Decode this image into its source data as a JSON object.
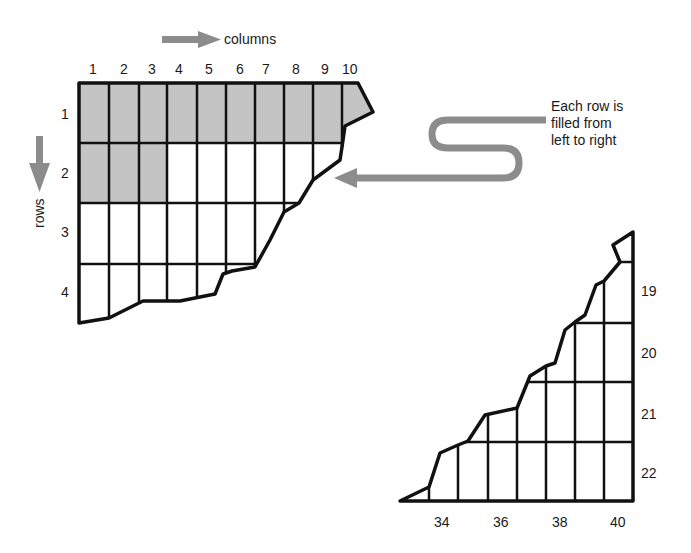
{
  "diagram": {
    "column_axis_label": "columns",
    "row_axis_label": "rows",
    "column_labels": [
      "1",
      "2",
      "3",
      "4",
      "5",
      "6",
      "7",
      "8",
      "9",
      "10"
    ],
    "row_labels": [
      "1",
      "2",
      "3",
      "4"
    ],
    "right_row_labels": [
      "19",
      "20",
      "21",
      "22"
    ],
    "right_column_labels": [
      "34",
      "36",
      "38",
      "40"
    ],
    "note": {
      "line1": "Each row is",
      "line2": "filled from",
      "line3": "left to right"
    },
    "colors": {
      "filled_cell": "#c4c4c4",
      "empty_cell": "#ffffff",
      "grid_line": "#111111",
      "arrow": "#8c8c8c"
    }
  }
}
